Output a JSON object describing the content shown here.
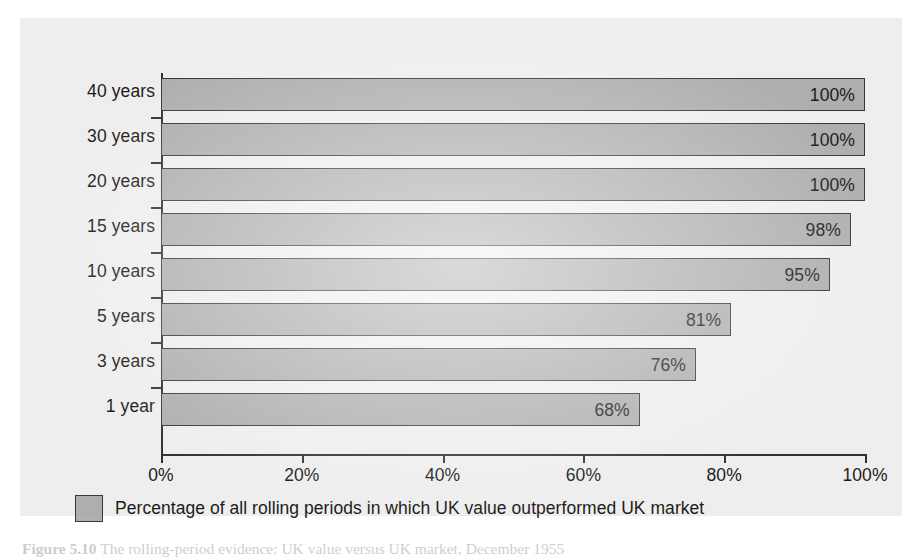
{
  "chart_data": {
    "type": "bar",
    "orientation": "horizontal",
    "title": "",
    "xlabel": "",
    "ylabel": "",
    "categories": [
      "40 years",
      "30 years",
      "20 years",
      "15 years",
      "10 years",
      "5 years",
      "3 years",
      "1 year"
    ],
    "values": [
      100,
      100,
      100,
      98,
      95,
      81,
      76,
      68
    ],
    "value_labels": [
      "100%",
      "100%",
      "100%",
      "98%",
      "95%",
      "81%",
      "76%",
      "68%"
    ],
    "series": [
      {
        "name": "Percentage of all rolling periods in which UK value outperformed UK market",
        "values": [
          100,
          100,
          100,
          98,
          95,
          81,
          76,
          68
        ]
      }
    ],
    "xlim": [
      0,
      100
    ],
    "xticks": [
      0,
      20,
      40,
      60,
      80,
      100
    ],
    "xtick_labels": [
      "0%",
      "20%",
      "40%",
      "60%",
      "80%",
      "100%"
    ],
    "grid": false,
    "legend_position": "bottom-left",
    "bar_color": "#b0b0b0",
    "bar_border_color": "#3a3734",
    "axis_color": "#33302e",
    "text_color": "#1d1b1a",
    "panel_background": "#f0f0f0"
  },
  "legend": {
    "entries": [
      {
        "label": "Percentage of all rolling periods in which UK value outperformed UK market",
        "swatch_color": "#b0b0b0"
      }
    ]
  },
  "caption": {
    "figure_number": "Figure 5.10",
    "text": "The rolling-period evidence: UK value versus UK market, December 1955"
  }
}
